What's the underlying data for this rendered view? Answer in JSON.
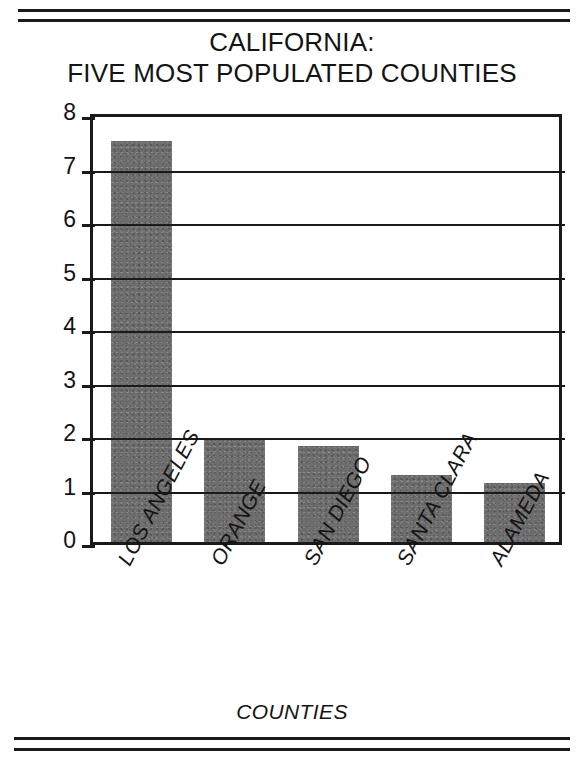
{
  "page": {
    "background_color": "#ffffff",
    "rules": {
      "top_count": 2,
      "bottom_count": 2,
      "color": "#1a1a1a"
    }
  },
  "chart_data": {
    "type": "bar",
    "title": "CALIFORNIA: FIVE MOST POPULATED COUNTIES",
    "title_lines": [
      "CALIFORNIA:",
      "FIVE MOST POPULATED COUNTIES"
    ],
    "categories": [
      "LOS ANGELES",
      "ORANGE",
      "SAN DIEGO",
      "SANTA CLARA",
      "ALAMEDA"
    ],
    "values": [
      7.5,
      1.9,
      1.8,
      1.25,
      1.1
    ],
    "xlabel": "COUNTIES",
    "ylabel": "MILLIONS OF PEOPLE",
    "ylim": [
      0,
      8
    ],
    "ytick_labels": [
      "0",
      "1",
      "2",
      "3",
      "4",
      "5",
      "6",
      "7",
      "8"
    ],
    "ytick_values": [
      0,
      1,
      2,
      3,
      4,
      5,
      6,
      7,
      8
    ],
    "grid": true,
    "grid_axis": "y",
    "legend": null,
    "bar_color": "#6e6e6e",
    "axis_color": "#1a1a1a",
    "units": "millions of people"
  }
}
